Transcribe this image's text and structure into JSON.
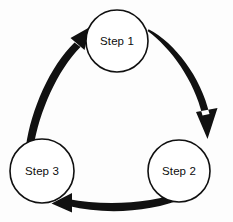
{
  "diagram": {
    "type": "cycle",
    "direction": "clockwise",
    "background_color": "#fdfdfd",
    "node_fill_color": "#ffffff",
    "node_stroke_color": "#101010",
    "arrow_color": "#111111",
    "nodes": [
      {
        "id": "step-1",
        "label": "Step 1",
        "cx": 117,
        "cy": 41,
        "r": 31
      },
      {
        "id": "step-2",
        "label": "Step 2",
        "cx": 179,
        "cy": 171,
        "r": 31
      },
      {
        "id": "step-3",
        "label": "Step 3",
        "cx": 42,
        "cy": 171,
        "r": 32
      }
    ],
    "arrows": [
      {
        "id": "arrow-step1-to-step2",
        "from": "step-1",
        "to": "step-2",
        "label": ""
      },
      {
        "id": "arrow-step2-to-step3",
        "from": "step-2",
        "to": "step-3",
        "label": ""
      },
      {
        "id": "arrow-step3-to-step1",
        "from": "step-3",
        "to": "step-1",
        "label": ""
      }
    ]
  }
}
